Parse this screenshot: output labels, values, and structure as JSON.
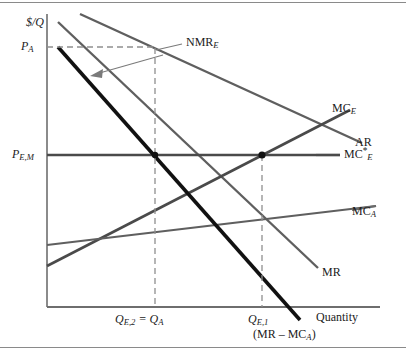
{
  "figure": {
    "axes": {
      "y_axis_label": "$/Q",
      "x_axis_label": "Quantity",
      "y_ticks": [
        {
          "label_html": "P<sub>A</sub>",
          "text": "P_A"
        },
        {
          "label_html": "P<sub>E,M</sub>",
          "text": "P_E,M"
        }
      ],
      "x_ticks": [
        {
          "label_html": "Q<sub>E,2</sub> = Q<sub>A</sub>",
          "text": "Q_E,2 = Q_A"
        },
        {
          "label_html": "Q<sub>E,1</sub>",
          "text": "Q_E,1"
        }
      ]
    },
    "curve_labels": {
      "mc_e": "MC<sub>E</sub>",
      "ar": "AR",
      "mc_e_star": "MC<sup>*</sup><sub>E</sub>",
      "mc_a": "MC<sub>A</sub>",
      "mr": "MR",
      "nmr_e": "NMR<sub>E</sub>",
      "mr_minus_mca": "(MR &ndash; MC<sub>A</sub>)"
    },
    "colors": {
      "curve_gray": "#5f5f5f",
      "curve_dark": "#4a4a4a",
      "curve_black": "#111111",
      "axis": "#6e6e6e",
      "dashed": "#8f8f8f",
      "text": "#1b1b1b"
    }
  },
  "chart_data": {
    "type": "line",
    "title": "",
    "xlabel": "Quantity",
    "ylabel": "$/Q",
    "grid": false,
    "legend": "inline-curve-labels",
    "axis_ranges": {
      "x_px": [
        47,
        380
      ],
      "y_px": [
        307,
        14
      ]
    },
    "y_reference_levels": [
      {
        "name": "P_A",
        "y_px": 47
      },
      {
        "name": "P_E,M",
        "y_px": 155
      }
    ],
    "x_reference_levels": [
      {
        "name": "Q_E,2 = Q_A",
        "x_px": 155
      },
      {
        "name": "Q_E,1",
        "x_px": 262
      }
    ],
    "series": [
      {
        "name": "AR",
        "label": "AR",
        "style": "solid-gray",
        "points_px": [
          [
            80,
            14
          ],
          [
            362,
            143
          ]
        ]
      },
      {
        "name": "MR",
        "label": "MR",
        "style": "solid-gray",
        "points_px": [
          [
            58,
            22
          ],
          [
            318,
            268
          ]
        ]
      },
      {
        "name": "MC_E",
        "label": "MC_E",
        "style": "solid-gray",
        "points_px": [
          [
            47,
            266
          ],
          [
            350,
            110
          ]
        ]
      },
      {
        "name": "MC_A",
        "label": "MC_A",
        "style": "solid-gray",
        "points_px": [
          [
            47,
            245
          ],
          [
            376,
            206
          ]
        ]
      },
      {
        "name": "MC*_E",
        "label": "MC*_E",
        "style": "solid-horizontal",
        "points_px": [
          [
            47,
            155
          ],
          [
            340,
            155
          ]
        ]
      },
      {
        "name": "(MR - MC_A)",
        "label": "(MR - MC_A)",
        "style": "thick-black",
        "points_px": [
          [
            58,
            47
          ],
          [
            300,
            320
          ]
        ]
      }
    ],
    "marked_points": [
      {
        "name": "NMR_E",
        "x_px": 155,
        "y_px": 48,
        "note": "AR intersects dashed P_A level"
      },
      {
        "name": "intersection-left",
        "x_px": 155,
        "y_px": 155,
        "note": "(MR-MC_A) crosses MC*_E"
      },
      {
        "name": "intersection-right",
        "x_px": 262,
        "y_px": 155,
        "note": "MC_E crosses MC*_E"
      }
    ],
    "annotations": [
      {
        "text": "NMR_E",
        "type": "callout-with-leader-and-arrow"
      }
    ]
  }
}
